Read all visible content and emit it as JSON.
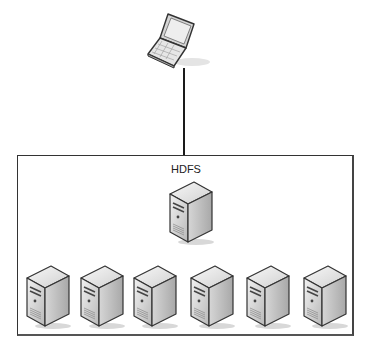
{
  "diagram": {
    "client": {
      "icon": "laptop-icon"
    },
    "cluster": {
      "label": "HDFS",
      "master": {
        "icon": "server-icon"
      },
      "nodes": [
        {
          "icon": "server-icon"
        },
        {
          "icon": "server-icon"
        },
        {
          "icon": "server-icon"
        },
        {
          "icon": "server-icon"
        },
        {
          "icon": "server-icon"
        },
        {
          "icon": "server-icon"
        }
      ]
    },
    "colors": {
      "line": "#1a1a1a",
      "border": "#333333"
    }
  }
}
